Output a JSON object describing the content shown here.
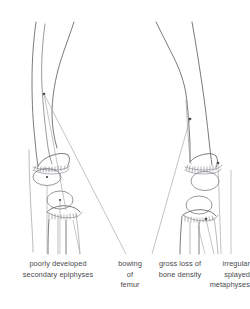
{
  "figure": {
    "ghost_line": "",
    "colors": {
      "ink": "#58585c",
      "ink_soft": "#6e6e74",
      "ink_faint": "#8d8d95",
      "leader": "#9a9aa2",
      "marker": "#3a3a3e",
      "background": "#ffffff",
      "label_text": "#4a4a4e"
    }
  },
  "annotations": [
    {
      "id": "poorly-developed-secondary-epiphyses",
      "lines": [
        "poorly developed",
        "secondary epiphyses"
      ],
      "target": "left patella and distal femoral epiphysis"
    },
    {
      "id": "bowing-of-femur",
      "lines": [
        "bowing",
        "of",
        "femur"
      ],
      "target": "left femoral shaft"
    },
    {
      "id": "gross-loss-of-bone-density",
      "lines": [
        "gross loss of",
        "bone density"
      ],
      "target": "right femoral shaft"
    },
    {
      "id": "irregular-splayed-metaphyses",
      "lines": [
        "irregular",
        "splayed",
        "metaphyses"
      ],
      "target": "right distal femoral and proximal tibial metaphyses"
    }
  ]
}
